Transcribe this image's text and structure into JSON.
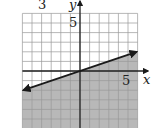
{
  "chart_data": {
    "type": "line",
    "title": "",
    "xlabel": "x",
    "ylabel": "y",
    "xlim": [
      -6,
      6
    ],
    "ylim": [
      -6,
      6
    ],
    "grid": true,
    "tick_labels": {
      "x": [
        "5"
      ],
      "y": [
        "5"
      ]
    },
    "series": [
      {
        "name": "boundary",
        "style": "solid",
        "arrows": "both",
        "x": [
          -6,
          0,
          6
        ],
        "y": [
          -2,
          0,
          2
        ]
      }
    ],
    "shaded_region": "below",
    "inequality": "y ≤ (1/3)x",
    "problem_number": "3",
    "legend": null
  },
  "labels": {
    "problem_number": "3",
    "y_axis": "y",
    "x_axis": "x",
    "x_tick": "5",
    "y_tick": "5"
  },
  "colors": {
    "shade": "#b8b8b8",
    "grid": "#999999",
    "axis": "#222222",
    "line": "#1a1a1a"
  }
}
